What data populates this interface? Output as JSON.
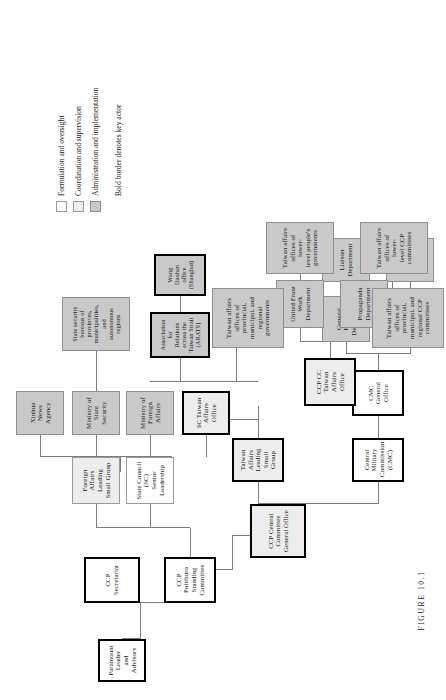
{
  "figure": {
    "caption": "FIGURE 10.1"
  },
  "legend": {
    "items": [
      {
        "label": "Formulation and oversight",
        "swatch": "#ffffff"
      },
      {
        "label": "Coordination and supervision",
        "swatch": "#ededed"
      },
      {
        "label": "Administration and implementation",
        "swatch": "#c9c9c9"
      }
    ],
    "note": "Bold border denotes key actor"
  },
  "nodes": {
    "paramount_leader": "Paramount Leader\nand Advisors",
    "ccp_secretariat": "CCP Secretariat",
    "ccp_psc": "CCP Politburo Standing\nCommittee",
    "ccp_cc_general_office": "CCP Central Committee\nGeneral Office",
    "foreign_affairs_lsg": "Foreign Affairs Leading\nSmall Group",
    "taiwan_affairs_lsg": "Taiwan Affairs Leading\nSmall Group",
    "state_council": "State Council (SC)\nSenior Leadership",
    "cmc": "Central Military\nCommission (CMC)",
    "cmc_general_office": "CMC\nGeneral Office",
    "ccp_cc_tao": "CCP CC Taiwan\nAffairs Office",
    "sc_tao": "SC Taiwan Affairs\nOffice",
    "mofa": "Ministry of\nForeign Affairs",
    "mss": "Ministry of\nState Security",
    "xinhua": "Xinhua\nNews Agency",
    "arats": "Association for\nRelations across the\nTaiwan Strait (ARATS)",
    "wang_daohan": "Wang Daohan office\n(Shanghai)",
    "state_security_bureaus": "State security\nbureaus of provinces,\nmunicipalities, and\nautonomous regions",
    "general_political_dept": "General Political\nDepartment",
    "general_staff_dept": "General Staff\nDepartment",
    "liaison_dept": "Liaison\nDepartment",
    "nanjing_mr": "Nanjing\nMilitary Region",
    "united_front_dept": "United Front\nWork Department",
    "propaganda_dept": "Propaganda\nDepartment",
    "tao_provincial_ccp": "Taiwan affairs\noffices of provincial,\nmunicipal, and\nregional CCP\ncommittees",
    "tao_lower_ccp": "Taiwan affairs\noffices of lower-\nlevel CCP\ncommittees",
    "tao_provincial_gov": "Taiwan affairs\noffices of provincial,\nmunicipal, and\nregional\ngovernments",
    "tao_lower_gov": "Taiwan affairs\noffices of lower-\nlevel people's\ngovernments"
  }
}
